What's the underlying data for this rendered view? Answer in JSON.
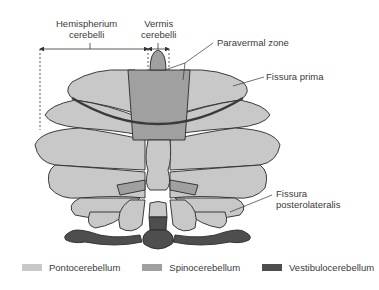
{
  "labels": {
    "hemispherium": [
      "Hemispherium",
      "cerebelli"
    ],
    "vermis": [
      "Vermis",
      "cerebelli"
    ],
    "paravermal": "Paravermal zone",
    "fissura_prima": "Fissura prima",
    "fissura_posterolateralis": [
      "Fissura",
      "posterolateralis"
    ]
  },
  "legend": [
    {
      "label": "Pontocerebellum",
      "color": "#c8c8c8"
    },
    {
      "label": "Spinocerebellum",
      "color": "#a0a0a0"
    },
    {
      "label": "Vestibulocerebellum",
      "color": "#4e4e4e"
    }
  ],
  "colors": {
    "ponto": "#c8c8c8",
    "spino": "#a0a0a0",
    "vestibulo": "#4e4e4e",
    "outline": "#2a2a2a"
  }
}
